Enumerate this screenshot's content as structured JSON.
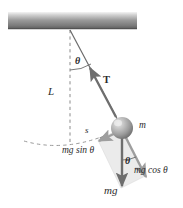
{
  "figure": {
    "type": "physics-free-body-diagram",
    "background_color": "#ffffff",
    "ink_color": "#2b2b2b"
  },
  "ceiling": {
    "name": "ceiling-support",
    "gradient_top": "#f2f2f2",
    "gradient_mid": "#8d8d8d",
    "gradient_bottom": "#5f5f5f",
    "x": 8,
    "y": 12,
    "width": 129,
    "height": 17
  },
  "pivot": {
    "x": 70,
    "y": 29
  },
  "bob": {
    "label": "m",
    "cx": 122,
    "cy": 128,
    "r": 11,
    "fill_light": "#d8d8d8",
    "fill_dark": "#7b7b7b"
  },
  "string": {
    "label": "L",
    "label_x": 50,
    "label_y": 86,
    "from_x": 70,
    "from_y": 29,
    "to_x": 122,
    "to_y": 128
  },
  "vertical_reference": {
    "name": "vertical-dashed-line",
    "x": 70,
    "from_y": 29,
    "to_y": 143,
    "style": "dashed"
  },
  "angles": [
    {
      "name": "theta-at-pivot",
      "label": "θ",
      "x": 75,
      "y": 62
    },
    {
      "name": "theta-at-bob",
      "label": "θ",
      "x": 126,
      "y": 160
    }
  ],
  "vectors": [
    {
      "name": "tension",
      "label": "T",
      "label_x": 103,
      "label_y": 79,
      "bold": true,
      "direction": "up-left along string",
      "color": "#6e6e6e"
    },
    {
      "name": "weight",
      "label": "mg",
      "label_x": 105,
      "label_y": 185,
      "bold_g": true,
      "direction": "straight down",
      "color": "#6e6e6e"
    },
    {
      "name": "tangential-component",
      "label": "mg sin θ",
      "label_x": 62,
      "label_y": 146,
      "direction": "perpendicular to string, toward equilibrium",
      "color": "#9a9a9a"
    },
    {
      "name": "radial-component",
      "label": "mg cos θ",
      "label_x": 134,
      "label_y": 166,
      "direction": "along string, away from pivot",
      "color": "#9a9a9a"
    }
  ],
  "arc": {
    "name": "arc-length-path",
    "label": "s",
    "label_x": 85,
    "label_y": 130,
    "style": "dashed",
    "description": "dashed arc of pendulum swing with arrow at bob"
  },
  "parallelogram": {
    "name": "component-parallelogram",
    "fill": "#d9d9d9",
    "opacity": 0.55
  }
}
